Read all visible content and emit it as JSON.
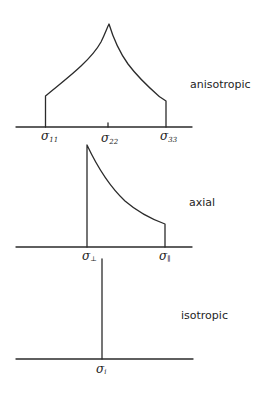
{
  "diagram": {
    "stroke_color": "#2b2b2b",
    "panels": [
      {
        "name": "anisotropic",
        "label": "anisotropic",
        "axis_labels": [
          {
            "symbol": "σ",
            "subscript": "11"
          },
          {
            "symbol": "σ",
            "subscript": "22"
          },
          {
            "symbol": "σ",
            "subscript": "33"
          }
        ]
      },
      {
        "name": "axial",
        "label": "axial",
        "axis_labels": [
          {
            "symbol": "σ",
            "subscript": "⊥"
          },
          {
            "symbol": "σ",
            "subscript": "∥"
          }
        ]
      },
      {
        "name": "isotropic",
        "label": "isotropic",
        "axis_labels": [
          {
            "symbol": "σ",
            "subscript": "i"
          }
        ]
      }
    ]
  }
}
